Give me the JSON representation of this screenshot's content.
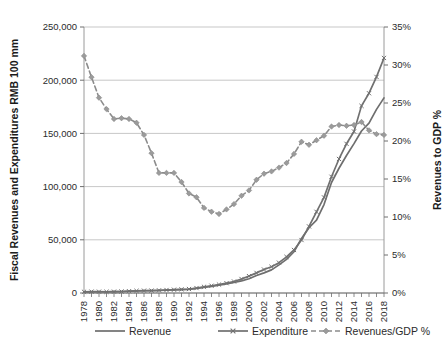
{
  "chart_data": {
    "type": "line",
    "title": "",
    "xlabel": "",
    "x": [
      1978,
      1979,
      1980,
      1981,
      1982,
      1983,
      1984,
      1985,
      1986,
      1987,
      1988,
      1989,
      1990,
      1991,
      1992,
      1993,
      1994,
      1995,
      1996,
      1997,
      1998,
      1999,
      2000,
      2001,
      2002,
      2003,
      2004,
      2005,
      2006,
      2007,
      2008,
      2009,
      2010,
      2011,
      2012,
      2013,
      2014,
      2015,
      2016,
      2017,
      2018
    ],
    "xlim": [
      1978,
      2018
    ],
    "xtick_labels": [
      "1978",
      "1980",
      "1982",
      "1984",
      "1986",
      "1988",
      "1990",
      "1992",
      "1994",
      "1996",
      "1998",
      "2000",
      "2002",
      "2004",
      "2006",
      "2008",
      "2010",
      "2012",
      "2014",
      "2016",
      "2018"
    ],
    "xtick_values": [
      1978,
      1980,
      1982,
      1984,
      1986,
      1988,
      1990,
      1992,
      1994,
      1996,
      1998,
      2000,
      2002,
      2004,
      2006,
      2008,
      2010,
      2012,
      2014,
      2016,
      2018
    ],
    "grid": true,
    "legend_position": "bottom",
    "left_axis": {
      "label": "Fiscal Revenues and Expenditures RMB 100 mm",
      "ylim": [
        0,
        250000
      ],
      "tick_values": [
        0,
        50000,
        100000,
        150000,
        200000,
        250000
      ],
      "tick_labels": [
        "0",
        "50,000",
        "100,000",
        "150,000",
        "200,000",
        "250,000"
      ]
    },
    "right_axis": {
      "label": "Revenues to GDP %",
      "ylim": [
        0,
        35
      ],
      "tick_values": [
        0,
        5,
        10,
        15,
        20,
        25,
        30,
        35
      ],
      "tick_labels": [
        "0%",
        "5%",
        "10%",
        "15%",
        "20%",
        "25%",
        "30%",
        "35%"
      ]
    },
    "series": [
      {
        "name": "Revenue",
        "axis": "left",
        "marker": "none",
        "dash": "solid",
        "color": "#6e6e6e",
        "values": [
          1132,
          1146,
          1160,
          1176,
          1212,
          1367,
          1643,
          2005,
          2122,
          2199,
          2357,
          2665,
          2937,
          3149,
          3483,
          4349,
          5218,
          6242,
          7408,
          8651,
          9876,
          11444,
          13395,
          16386,
          18904,
          21715,
          26396,
          31649,
          38760,
          51322,
          61330,
          68518,
          83102,
          103874,
          117254,
          129210,
          140370,
          152269,
          159605,
          172593,
          183360
        ]
      },
      {
        "name": "Expenditure",
        "axis": "left",
        "marker": "x",
        "dash": "solid",
        "color": "#707070",
        "values": [
          1122,
          1281,
          1229,
          1138,
          1230,
          1410,
          1701,
          2004,
          2205,
          2262,
          2491,
          2824,
          3084,
          3387,
          3742,
          4642,
          5793,
          6824,
          7938,
          9234,
          10798,
          13188,
          15887,
          18903,
          22053,
          24650,
          28487,
          33930,
          40423,
          49781,
          62593,
          76300,
          89874,
          109248,
          125953,
          140212,
          151786,
          175878,
          187755,
          203085,
          220906
        ]
      },
      {
        "name": "Revenues/GDP %",
        "axis": "right",
        "marker": "diamond",
        "dash": "dashed",
        "color": "#8c8c8c",
        "values": [
          31.2,
          28.4,
          25.7,
          24.2,
          22.9,
          23.0,
          22.9,
          22.4,
          20.8,
          18.4,
          15.8,
          15.8,
          15.8,
          14.6,
          13.1,
          12.6,
          11.2,
          10.7,
          10.4,
          11.0,
          11.7,
          12.8,
          13.5,
          14.9,
          15.7,
          16.0,
          16.5,
          17.1,
          18.3,
          19.9,
          19.5,
          20.1,
          20.7,
          21.9,
          22.1,
          22.0,
          22.1,
          22.5,
          21.4,
          20.9,
          20.8
        ]
      }
    ]
  },
  "legend": {
    "items": [
      {
        "label": "Revenue"
      },
      {
        "label": "Expenditure"
      },
      {
        "label": "Revenues/GDP %"
      }
    ]
  }
}
